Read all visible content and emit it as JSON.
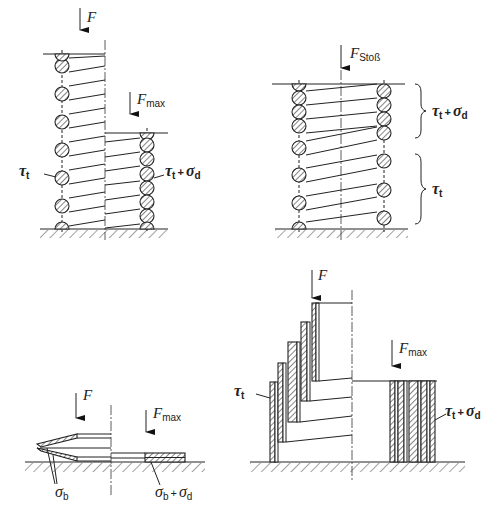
{
  "figures": [
    {
      "id": "coil-spring-static",
      "load_labels": {
        "force": "F",
        "force_max": "F",
        "force_max_sub": "max"
      },
      "stress_labels": {
        "left": "τ",
        "left_sub": "t",
        "right": "τ",
        "right_sub": "t",
        "right_plus": "+",
        "right_sigma": "σ",
        "right_sigma_sub": "d"
      }
    },
    {
      "id": "coil-spring-impact",
      "load_labels": {
        "force": "F",
        "force_sub": "Stoß"
      },
      "stress_labels": {
        "upper": "τ",
        "upper_sub": "t",
        "upper_plus": "+",
        "upper_sigma": "σ",
        "upper_sigma_sub": "d",
        "lower": "τ",
        "lower_sub": "t"
      }
    },
    {
      "id": "disc-spring",
      "load_labels": {
        "force": "F",
        "force_max": "F",
        "force_max_sub": "max"
      },
      "stress_labels": {
        "left": "σ",
        "left_sub": "b",
        "right": "σ",
        "right_sub": "b",
        "right_plus": "+",
        "right_sigma": "σ",
        "right_sigma_sub": "d"
      }
    },
    {
      "id": "volute-spring",
      "load_labels": {
        "force": "F",
        "force_max": "F",
        "force_max_sub": "max"
      },
      "stress_labels": {
        "left": "τ",
        "left_sub": "t",
        "right": "τ",
        "right_sub": "t",
        "right_plus": "+",
        "right_sigma": "σ",
        "right_sigma_sub": "d"
      }
    }
  ]
}
